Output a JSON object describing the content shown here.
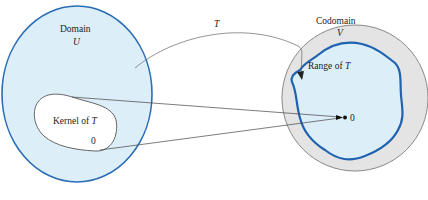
{
  "diagram": {
    "domain": {
      "label": "Domain",
      "symbol": "U",
      "fill": "#dceef8",
      "stroke": "#2a6db5"
    },
    "kernel": {
      "label_prefix": "Kernel of ",
      "label_symbol": "T",
      "zero": "0",
      "fill": "#ffffff",
      "stroke": "#555555"
    },
    "mapping": {
      "label": "T"
    },
    "codomain": {
      "label": "Codomain",
      "symbol": "V",
      "fill": "#e4e4e4",
      "stroke": "#888888"
    },
    "range": {
      "label_prefix": "Range of ",
      "label_symbol": "T",
      "zero": "0",
      "fill": "#dceef8",
      "stroke": "#1f63b0"
    }
  }
}
